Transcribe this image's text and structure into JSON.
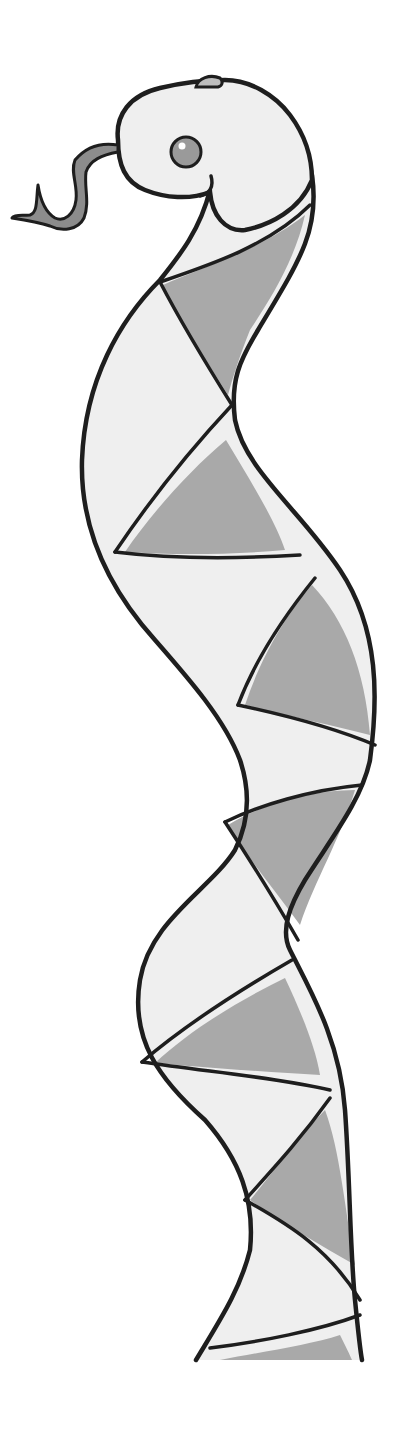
{
  "image": {
    "subject": "Hand-drawn watercolor illustration of a snake with a triangular checkered pattern",
    "palette": {
      "background": "#ffffff",
      "body_light": "#efefef",
      "body_dark": "#a9a9a9",
      "outline": "#1e1e1e",
      "tongue": "#8c8c8c",
      "eye_iris": "#9a9a9a"
    },
    "elements": [
      "snake-head",
      "snake-eye",
      "forked-tongue",
      "snake-body",
      "light-segments",
      "dark-segments"
    ]
  }
}
